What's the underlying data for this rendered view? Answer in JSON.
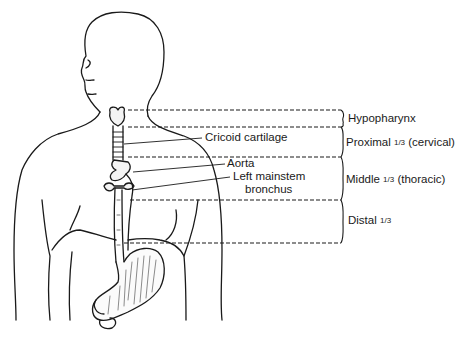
{
  "diagram": {
    "colors": {
      "line": "#1a1a1a",
      "background": "#ffffff"
    },
    "anatomy_labels": [
      {
        "id": "cricoid",
        "text": "Cricoid cartilage"
      },
      {
        "id": "aorta",
        "text": "Aorta"
      },
      {
        "id": "bronchus_line1",
        "text": "Left mainstem"
      },
      {
        "id": "bronchus_line2",
        "text": "bronchus"
      }
    ],
    "regions": [
      {
        "name": "Hypopharynx",
        "fraction": "",
        "qualifier": ""
      },
      {
        "name": "Proximal",
        "fraction": "1/3",
        "qualifier": "(cervical)"
      },
      {
        "name": "Middle",
        "fraction": "1/3",
        "qualifier": "(thoracic)"
      },
      {
        "name": "Distal",
        "fraction": "1/3",
        "qualifier": ""
      }
    ]
  }
}
